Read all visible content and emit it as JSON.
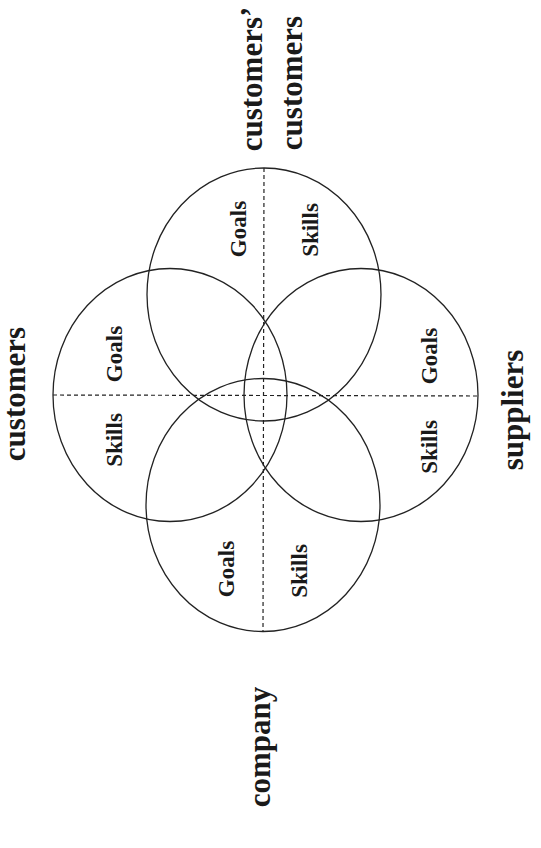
{
  "diagram": {
    "type": "four-circle overlapping venn-style diagram (rotated 90°)",
    "outer_labels": {
      "top_line1": "customers’",
      "top_line2": "customers",
      "left": "customers",
      "right": "suppliers",
      "bottom": "company"
    },
    "circles": [
      {
        "id": "top",
        "represents": "customers’ customers",
        "left_half": "Goals",
        "right_half": "Skills"
      },
      {
        "id": "left",
        "represents": "customers",
        "upper_half": "Goals",
        "lower_half": "Skills"
      },
      {
        "id": "right",
        "represents": "suppliers",
        "upper_half": "Goals",
        "lower_half": "Skills"
      },
      {
        "id": "bottom",
        "represents": "company",
        "left_half": "Goals",
        "right_half": "Skills"
      }
    ],
    "colors": {
      "stroke": "#222222",
      "text": "#1a1a1a",
      "background": "#ffffff"
    }
  }
}
